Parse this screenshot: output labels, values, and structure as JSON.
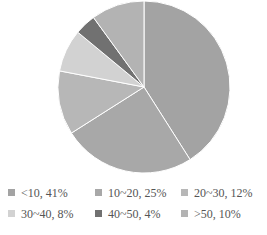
{
  "chart_data": {
    "type": "pie",
    "title": "",
    "categories": [
      "<10",
      "10~20",
      "20~30",
      "30~40",
      "40~50",
      ">50"
    ],
    "values": [
      41,
      25,
      12,
      8,
      4,
      10
    ],
    "colors": [
      "#a3a3a3",
      "#a8a8a8",
      "#b7b7b7",
      "#d2d2d2",
      "#717171",
      "#b3b3b3"
    ],
    "legend_labels": [
      "<10, 41%",
      "10~20, 25%",
      "20~30, 12%",
      "30~40, 8%",
      "40~50, 4%",
      ">50, 10%"
    ],
    "legend_position": "bottom",
    "start_angle": "12 o'clock, clockwise"
  }
}
